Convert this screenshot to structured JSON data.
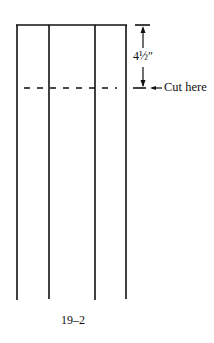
{
  "figure": {
    "dimension_label": "4½″",
    "cut_label": "Cut here",
    "caption": "19–2"
  }
}
